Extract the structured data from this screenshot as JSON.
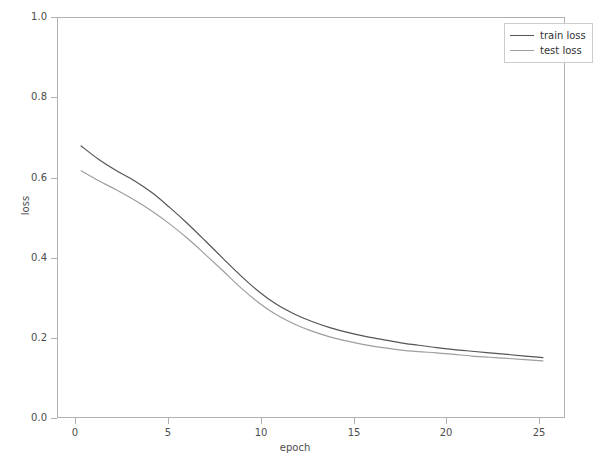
{
  "chart_data": {
    "type": "line",
    "title": "",
    "xlabel": "epoch",
    "ylabel": "loss",
    "xlim": [
      -1.3,
      27.3
    ],
    "ylim": [
      0.0,
      1.0
    ],
    "grid": false,
    "legend_position": "upper right",
    "xticks": [
      0,
      5,
      10,
      15,
      20,
      25
    ],
    "xtick_labels": [
      "0",
      "5",
      "10",
      "15",
      "20",
      "25"
    ],
    "yticks": [
      0.0,
      0.2,
      0.4,
      0.6,
      0.8,
      1.0
    ],
    "ytick_labels": [
      "0.0",
      "0.2",
      "0.4",
      "0.6",
      "0.8",
      "1.0"
    ],
    "x": [
      0,
      1,
      2,
      3,
      4,
      5,
      6,
      7,
      8,
      9,
      10,
      11,
      12,
      13,
      14,
      15,
      16,
      17,
      18,
      19,
      20,
      21,
      22,
      23,
      24,
      25,
      26
    ],
    "series": [
      {
        "name": "train loss",
        "color": "#555555",
        "values": [
          0.681,
          0.647,
          0.619,
          0.594,
          0.564,
          0.527,
          0.487,
          0.444,
          0.4,
          0.357,
          0.318,
          0.286,
          0.262,
          0.243,
          0.228,
          0.216,
          0.206,
          0.198,
          0.19,
          0.184,
          0.178,
          0.173,
          0.169,
          0.165,
          0.161,
          0.157,
          0.153
        ]
      },
      {
        "name": "test loss",
        "color": "#9e9e9e",
        "values": [
          0.619,
          0.594,
          0.571,
          0.546,
          0.518,
          0.486,
          0.45,
          0.41,
          0.369,
          0.327,
          0.29,
          0.26,
          0.237,
          0.219,
          0.205,
          0.194,
          0.185,
          0.178,
          0.172,
          0.168,
          0.165,
          0.161,
          0.157,
          0.154,
          0.151,
          0.148,
          0.145
        ]
      }
    ]
  },
  "legend": {
    "entries": [
      {
        "label": "train loss"
      },
      {
        "label": "test loss"
      }
    ]
  },
  "axis": {
    "frame_color": "#b0b0b0",
    "tick_color": "#4d4d4d"
  }
}
